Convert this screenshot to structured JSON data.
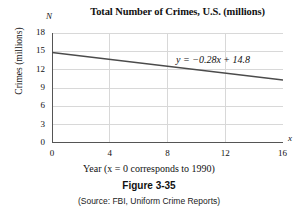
{
  "figure": {
    "title": "Total Number of Crimes, U.S. (millions)",
    "number": "Figure 3-35",
    "source": "(Source: FBI, Uniform Crime Reports)",
    "x_axis_caption": "Year (x = 0 corresponds to 1990)",
    "y_axis_letter": "N",
    "x_axis_letter": "x"
  },
  "chart_data": {
    "type": "line",
    "title": "Total Number of Crimes, U.S. (millions)",
    "xlabel": "Year (x = 0 corresponds to 1990)",
    "ylabel": "Crimes (millions)",
    "xlim": [
      0,
      16
    ],
    "ylim": [
      0,
      18
    ],
    "xticks": [
      "0",
      "4",
      "8",
      "12",
      "16"
    ],
    "xtick_values": [
      0,
      4,
      8,
      12,
      16
    ],
    "yticks": [
      "0",
      "3",
      "6",
      "9",
      "12",
      "15",
      "18"
    ],
    "ytick_values": [
      0,
      3,
      6,
      9,
      12,
      15,
      18
    ],
    "grid": true,
    "legend": "none",
    "annotation": "y = −0.28x + 14.8",
    "equation": {
      "slope": -0.28,
      "intercept": 14.8
    },
    "series": [
      {
        "name": "y = −0.28x + 14.8",
        "color": "#4b4b4b",
        "x": [
          0,
          16
        ],
        "values": [
          14.8,
          10.32
        ]
      }
    ]
  },
  "colors": {
    "line": "#4b4b4b",
    "axis": "#555555",
    "grid": "#d8d8d8",
    "text": "#111111",
    "background": "#ffffff"
  }
}
